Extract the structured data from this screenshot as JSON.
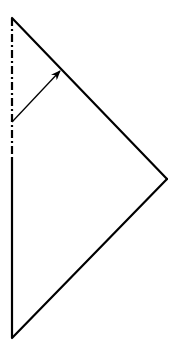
{
  "diagram": {
    "type": "geometric-construction",
    "colors": {
      "background": "#ffffff",
      "stroke": "#000000"
    },
    "vertices": {
      "top": [
        12,
        18
      ],
      "right": [
        167,
        179
      ],
      "bottom": [
        12,
        338
      ]
    },
    "axis": {
      "style": "dash-dot",
      "from": [
        12,
        18
      ],
      "to": [
        12,
        157
      ]
    },
    "solid_left_edge": {
      "from": [
        12,
        157
      ],
      "to": [
        12,
        338
      ]
    },
    "arrow": {
      "from": [
        12,
        122
      ],
      "to": [
        61,
        70
      ]
    }
  }
}
